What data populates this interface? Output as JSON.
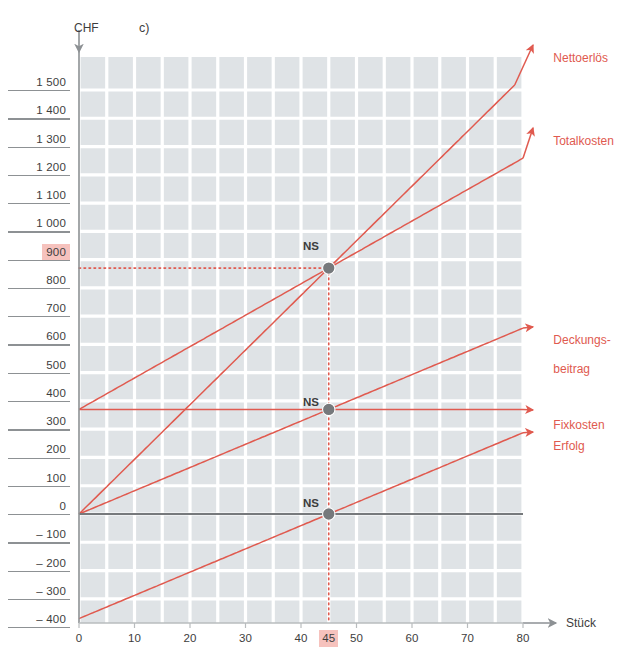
{
  "figure": {
    "panel_letter": "c)",
    "y_axis_title": "CHF",
    "x_axis_title": "Stück",
    "highlight_color": "#f6c2bd",
    "series_color": "#e05a4f",
    "axis_color": "#8d9194",
    "grid_cell_color": "#dfe3e6",
    "marker_color": "#76797c"
  },
  "chart_data": {
    "type": "line",
    "title": "",
    "xlabel": "Stück",
    "ylabel": "CHF",
    "xlim": [
      0,
      80
    ],
    "ylim": [
      -400,
      1500
    ],
    "grid": true,
    "legend_position": "right",
    "x_ticks": [
      "0",
      "10",
      "20",
      "30",
      "40",
      "45",
      "50",
      "60",
      "70",
      "80"
    ],
    "x_tick_values": [
      0,
      10,
      20,
      30,
      40,
      45,
      50,
      60,
      70,
      80
    ],
    "highlighted_x_tick": "45",
    "y_ticks": [
      "1 500",
      "1 400",
      "1 300",
      "1 200",
      "1 100",
      "1 000",
      "900",
      "800",
      "700",
      "600",
      "500",
      "400",
      "300",
      "200",
      "100",
      "0",
      "– 100",
      "– 200",
      "– 300",
      "– 400"
    ],
    "y_tick_values": [
      1500,
      1400,
      1300,
      1200,
      1100,
      1000,
      900,
      800,
      700,
      600,
      500,
      400,
      300,
      200,
      100,
      0,
      -100,
      -200,
      -300,
      -400
    ],
    "highlighted_y_tick": "900",
    "series": [
      {
        "name": "Nettoerlös",
        "label_lines": [
          "Nettoerlös"
        ],
        "intercept": 0,
        "slope": 19.333,
        "x_from": 0,
        "x_to": 80
      },
      {
        "name": "Totalkosten",
        "label_lines": [
          "Totalkosten"
        ],
        "intercept": 370,
        "slope": 11.11,
        "x_from": 0,
        "x_to": 80
      },
      {
        "name": "Deckungsbeitrag",
        "label_lines": [
          "Deckungs-",
          "beitrag"
        ],
        "intercept": 0,
        "slope": 8.22,
        "x_from": 0,
        "x_to": 80
      },
      {
        "name": "Fixkosten",
        "label_lines": [
          "Fixkosten"
        ],
        "intercept": 370,
        "slope": 0,
        "x_from": 0,
        "x_to": 80
      },
      {
        "name": "Erfolg",
        "label_lines": [
          "Erfolg"
        ],
        "intercept": -370,
        "slope": 8.22,
        "x_from": 0,
        "x_to": 80
      }
    ],
    "break_even": {
      "x": 45,
      "marker_label": "NS",
      "points": [
        {
          "x": 45,
          "y": 870,
          "label": "NS"
        },
        {
          "x": 45,
          "y": 370,
          "label": "NS"
        },
        {
          "x": 45,
          "y": 0,
          "label": "NS"
        }
      ],
      "guide_y_value": 870,
      "guide_x_value": 45
    },
    "annotations": [
      {
        "text": "c)",
        "role": "panel-letter"
      }
    ]
  },
  "y_axis": {
    "ticks": [
      {
        "label": "1 500",
        "highlight": false
      },
      {
        "label": "1 400",
        "highlight": false
      },
      {
        "label": "1 300",
        "highlight": false
      },
      {
        "label": "1 200",
        "highlight": false
      },
      {
        "label": "1 100",
        "highlight": false
      },
      {
        "label": "1 000",
        "highlight": false
      },
      {
        "label": "900",
        "highlight": true
      },
      {
        "label": "800",
        "highlight": false
      },
      {
        "label": "700",
        "highlight": false
      },
      {
        "label": "600",
        "highlight": false
      },
      {
        "label": "500",
        "highlight": false
      },
      {
        "label": "400",
        "highlight": false
      },
      {
        "label": "300",
        "highlight": false
      },
      {
        "label": "200",
        "highlight": false
      },
      {
        "label": "100",
        "highlight": false
      },
      {
        "label": "0",
        "highlight": false
      },
      {
        "label": "– 100",
        "highlight": false
      },
      {
        "label": "– 200",
        "highlight": false
      },
      {
        "label": "– 300",
        "highlight": false
      },
      {
        "label": "– 400",
        "highlight": false
      }
    ]
  },
  "x_axis": {
    "ticks": [
      {
        "label": "0",
        "highlight": false
      },
      {
        "label": "10",
        "highlight": false
      },
      {
        "label": "20",
        "highlight": false
      },
      {
        "label": "30",
        "highlight": false
      },
      {
        "label": "40",
        "highlight": false
      },
      {
        "label": "45",
        "highlight": true
      },
      {
        "label": "50",
        "highlight": false
      },
      {
        "label": "60",
        "highlight": false
      },
      {
        "label": "70",
        "highlight": false
      },
      {
        "label": "80",
        "highlight": false
      }
    ]
  },
  "legend": {
    "items": [
      {
        "name": "Nettoerlös",
        "line1": "Nettoerlös",
        "line2": ""
      },
      {
        "name": "Totalkosten",
        "line1": "Totalkosten",
        "line2": ""
      },
      {
        "name": "Deckungsbeitrag",
        "line1": "Deckungs-",
        "line2": "beitrag"
      },
      {
        "name": "Fixkosten",
        "line1": "Fixkosten",
        "line2": ""
      },
      {
        "name": "Erfolg",
        "line1": "Erfolg",
        "line2": ""
      }
    ]
  },
  "markers": {
    "ns_top": "NS",
    "ns_mid": "NS",
    "ns_bottom": "NS"
  }
}
